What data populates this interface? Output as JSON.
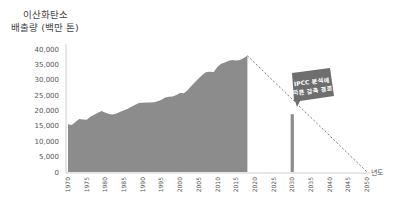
{
  "chart_data": {
    "type": "area",
    "title": "이산화탄소 배출량 (백만 톤)",
    "title_lines": [
      "이산화탄소",
      "배출량 (백만 톤)"
    ],
    "xlabel": "년도",
    "ylabel": "이산화탄소 배출량 (백만 톤)",
    "ylim": [
      0,
      40000
    ],
    "xlim": [
      1970,
      2050
    ],
    "y_ticks": [
      "40,000",
      "35,000",
      "30,000",
      "25,000",
      "20,000",
      "15,000",
      "10,000",
      "5,000",
      "0"
    ],
    "x_ticks": [
      "1970",
      "1975",
      "1980",
      "1985",
      "1990",
      "1995",
      "2000",
      "2005",
      "2010",
      "2015",
      "2020",
      "2025",
      "2030",
      "2035",
      "2040",
      "2045",
      "2050"
    ],
    "grid": false,
    "series": [
      {
        "name": "Historical CO2 emissions",
        "style": "filled-area",
        "color": "#8c8c8c",
        "x": [
          1970,
          1971,
          1972,
          1973,
          1974,
          1975,
          1976,
          1977,
          1978,
          1979,
          1980,
          1981,
          1982,
          1983,
          1984,
          1985,
          1986,
          1987,
          1988,
          1989,
          1990,
          1991,
          1992,
          1993,
          1994,
          1995,
          1996,
          1997,
          1998,
          1999,
          2000,
          2001,
          2002,
          2003,
          2004,
          2005,
          2006,
          2007,
          2008,
          2009,
          2010,
          2011,
          2012,
          2013,
          2014,
          2015,
          2016,
          2017,
          2018
        ],
        "values": [
          15500,
          15300,
          16300,
          17200,
          17100,
          17000,
          18000,
          18600,
          19300,
          19800,
          19300,
          18900,
          18700,
          19000,
          19600,
          20100,
          20600,
          21200,
          21900,
          22400,
          22500,
          22600,
          22600,
          22700,
          23000,
          23500,
          24200,
          24500,
          24600,
          25000,
          25700,
          25600,
          26600,
          28000,
          29300,
          30500,
          31600,
          32500,
          32600,
          32500,
          34200,
          35200,
          35600,
          36200,
          36400,
          36300,
          36400,
          37100,
          37800
        ]
      },
      {
        "name": "IPCC 분석에 따른 감축 경로",
        "style": "dashed-line",
        "color": "#777777",
        "x": [
          2018,
          2030,
          2050
        ],
        "values": [
          37800,
          19000,
          0
        ]
      },
      {
        "name": "2030 target",
        "style": "bar",
        "color": "#8c8c8c",
        "x": [
          2030
        ],
        "values": [
          18800
        ]
      }
    ],
    "annotations": [
      {
        "text": "IPCC 분석에 따른 감축 경로",
        "lines": [
          "IPCC 분석에",
          "따른 감축 경로"
        ],
        "x": 2033,
        "y": 30000,
        "style": "speech-bubble"
      }
    ]
  }
}
